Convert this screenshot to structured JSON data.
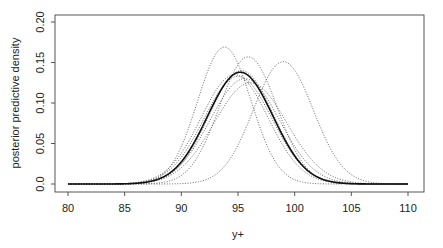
{
  "chart_data": {
    "type": "line",
    "title": "",
    "xlabel": "y+",
    "ylabel": "posterior predictive density",
    "xlim": [
      80,
      110
    ],
    "ylim": [
      0,
      0.2
    ],
    "xticks": [
      80,
      85,
      90,
      95,
      100,
      105,
      110
    ],
    "xtick_labels": [
      "80",
      "85",
      "90",
      "95",
      "100",
      "105",
      "110"
    ],
    "yticks": [
      0.0,
      0.05,
      0.1,
      0.15,
      0.2
    ],
    "ytick_labels": [
      "0.0",
      "0.05",
      "0.10",
      "0.15",
      "0.20"
    ],
    "grid": false,
    "legend": null,
    "x": [
      80,
      81,
      82,
      83,
      84,
      85,
      86,
      87,
      88,
      89,
      90,
      91,
      92,
      93,
      94,
      95,
      96,
      97,
      98,
      99,
      100,
      101,
      102,
      103,
      104,
      105,
      106,
      107,
      108,
      109,
      110
    ],
    "series": [
      {
        "name": "posterior predictive (solid)",
        "style": "solid",
        "mean": 95.2,
        "peak": 0.138,
        "values": [
          0.0,
          0.0,
          0.0,
          0.0001,
          0.0006,
          0.0017,
          0.0047,
          0.0111,
          0.0233,
          0.0434,
          0.0689,
          0.097,
          0.1192,
          0.132,
          0.1386,
          0.1379,
          0.13,
          0.1129,
          0.0874,
          0.0609,
          0.0366,
          0.019,
          0.0087,
          0.0034,
          0.0012,
          0.0004,
          0.0001,
          0.0,
          0.0,
          0.0,
          0.0
        ]
      },
      {
        "name": "sample 1",
        "style": "dotted",
        "mean": 93.8,
        "peak": 0.169,
        "values": [
          0.0,
          0.0,
          0.0,
          0.0002,
          0.001,
          0.0052,
          0.0162,
          0.0412,
          0.0817,
          0.1236,
          0.1494,
          0.1644,
          0.162,
          0.1519,
          0.1686,
          0.1411,
          0.1079,
          0.073,
          0.0376,
          0.0149,
          0.0052,
          0.0017,
          0.0004,
          0.0001,
          0.0,
          0.0,
          0.0,
          0.0,
          0.0,
          0.0,
          0.0
        ]
      },
      {
        "name": "sample 2",
        "style": "dotted",
        "mean": 95.9,
        "peak": 0.157,
        "values": [
          0.0,
          0.0,
          0.0,
          0.0,
          0.0,
          0.0002,
          0.0008,
          0.0032,
          0.0103,
          0.028,
          0.0599,
          0.0948,
          0.1271,
          0.1464,
          0.1493,
          0.1534,
          0.1569,
          0.1463,
          0.1151,
          0.0776,
          0.0426,
          0.0192,
          0.0071,
          0.0022,
          0.0005,
          0.0001,
          0.0,
          0.0,
          0.0,
          0.0,
          0.0
        ]
      },
      {
        "name": "sample 3",
        "style": "dotted",
        "mean": 99.0,
        "peak": 0.151,
        "values": [
          0.0,
          0.0,
          0.0,
          0.0,
          0.0,
          0.0,
          0.0,
          0.0001,
          0.0002,
          0.0011,
          0.0044,
          0.0139,
          0.0338,
          0.0624,
          0.0976,
          0.1215,
          0.1374,
          0.1464,
          0.1508,
          0.151,
          0.1412,
          0.1186,
          0.0818,
          0.0488,
          0.025,
          0.0113,
          0.0044,
          0.0015,
          0.0005,
          0.0001,
          0.0
        ]
      },
      {
        "name": "sample 4",
        "style": "dotted",
        "mean": 95.3,
        "peak": 0.14,
        "values": [
          0.0,
          0.0,
          0.0,
          0.0001,
          0.0004,
          0.0014,
          0.0042,
          0.0105,
          0.0229,
          0.0431,
          0.0697,
          0.0974,
          0.1186,
          0.1316,
          0.1388,
          0.14,
          0.1324,
          0.1154,
          0.0894,
          0.0621,
          0.0374,
          0.0195,
          0.0088,
          0.0035,
          0.0012,
          0.0004,
          0.0001,
          0.0,
          0.0,
          0.0,
          0.0
        ]
      },
      {
        "name": "sample 5",
        "style": "dotted",
        "mean": 95.0,
        "peak": 0.133,
        "values": [
          0.0,
          0.0,
          0.0001,
          0.0004,
          0.0012,
          0.0034,
          0.0083,
          0.0178,
          0.0334,
          0.0541,
          0.0771,
          0.0979,
          0.112,
          0.1232,
          0.1302,
          0.133,
          0.1276,
          0.1147,
          0.0941,
          0.0702,
          0.0476,
          0.029,
          0.0158,
          0.0077,
          0.0034,
          0.0013,
          0.0005,
          0.0001,
          0.0,
          0.0,
          0.0
        ]
      },
      {
        "name": "sample 6",
        "style": "dotted",
        "mean": 95.6,
        "peak": 0.13,
        "values": [
          0.0,
          0.0,
          0.0,
          0.0002,
          0.0006,
          0.0018,
          0.0049,
          0.0113,
          0.023,
          0.041,
          0.0638,
          0.0868,
          0.1047,
          0.119,
          0.1273,
          0.1299,
          0.129,
          0.1202,
          0.1023,
          0.0782,
          0.0531,
          0.0321,
          0.0171,
          0.008,
          0.0033,
          0.0012,
          0.0004,
          0.0001,
          0.0,
          0.0,
          0.0
        ]
      },
      {
        "name": "sample 7",
        "style": "dotted",
        "mean": 94.7,
        "peak": 0.135,
        "values": [
          0.0,
          0.0,
          0.0001,
          0.0005,
          0.0017,
          0.0048,
          0.0114,
          0.0232,
          0.0407,
          0.0617,
          0.083,
          0.1021,
          0.1184,
          0.1292,
          0.1343,
          0.1346,
          0.124,
          0.104,
          0.0793,
          0.0543,
          0.0333,
          0.0181,
          0.0087,
          0.0037,
          0.0014,
          0.0005,
          0.0001,
          0.0,
          0.0,
          0.0,
          0.0
        ]
      },
      {
        "name": "sample 8",
        "style": "dotted",
        "mean": 96.1,
        "peak": 0.125,
        "values": [
          0.0,
          0.0,
          0.0,
          0.0001,
          0.0004,
          0.0012,
          0.0033,
          0.0079,
          0.0165,
          0.0305,
          0.0497,
          0.0715,
          0.092,
          0.1083,
          0.119,
          0.124,
          0.1249,
          0.1217,
          0.1101,
          0.0906,
          0.0674,
          0.0453,
          0.0276,
          0.015,
          0.0073,
          0.0032,
          0.0012,
          0.0004,
          0.0001,
          0.0,
          0.0
        ]
      }
    ]
  },
  "plot": {
    "xlabel": "y+",
    "ylabel": "posterior predictive density"
  }
}
